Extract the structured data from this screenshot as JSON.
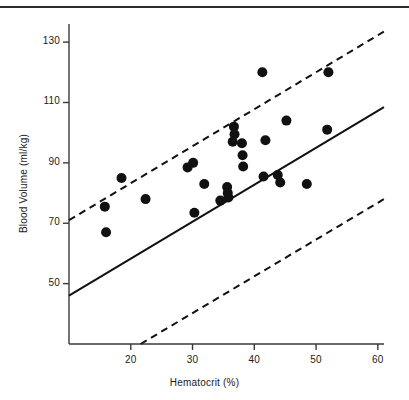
{
  "chart_data": {
    "type": "scatter",
    "title": "",
    "xlabel": "Hematocrit (%)",
    "ylabel": "Blood Volume (ml/kg)",
    "xlim": [
      10,
      61
    ],
    "ylim": [
      30,
      136
    ],
    "xticks": [
      20,
      30,
      40,
      50,
      60
    ],
    "yticks": [
      50,
      70,
      90,
      110,
      130
    ],
    "grid": false,
    "legend": null,
    "marker": {
      "shape": "circle",
      "color": "#111111",
      "size": 5
    },
    "points": [
      {
        "x": 15.8,
        "y": 75.5
      },
      {
        "x": 16.0,
        "y": 67.0
      },
      {
        "x": 18.5,
        "y": 85.0
      },
      {
        "x": 22.4,
        "y": 78.0
      },
      {
        "x": 29.2,
        "y": 88.5
      },
      {
        "x": 30.1,
        "y": 90.0
      },
      {
        "x": 30.3,
        "y": 73.5
      },
      {
        "x": 31.9,
        "y": 83.0
      },
      {
        "x": 34.5,
        "y": 77.5
      },
      {
        "x": 35.6,
        "y": 82.0
      },
      {
        "x": 35.7,
        "y": 80.0
      },
      {
        "x": 35.8,
        "y": 78.5
      },
      {
        "x": 36.5,
        "y": 97.0
      },
      {
        "x": 36.7,
        "y": 102.0
      },
      {
        "x": 36.8,
        "y": 99.5
      },
      {
        "x": 38.0,
        "y": 96.5
      },
      {
        "x": 38.1,
        "y": 92.5
      },
      {
        "x": 38.2,
        "y": 88.8
      },
      {
        "x": 41.3,
        "y": 120.0
      },
      {
        "x": 41.5,
        "y": 85.5
      },
      {
        "x": 41.8,
        "y": 97.5
      },
      {
        "x": 43.8,
        "y": 86.0
      },
      {
        "x": 44.2,
        "y": 83.5
      },
      {
        "x": 45.2,
        "y": 104.0
      },
      {
        "x": 48.5,
        "y": 83.0
      },
      {
        "x": 51.8,
        "y": 101.0
      },
      {
        "x": 52.0,
        "y": 120.0
      }
    ],
    "lines": [
      {
        "name": "regression-line",
        "style": "solid",
        "color": "#111111",
        "x0": 10.0,
        "y0": 46.0,
        "x1": 61.0,
        "y1": 108.5
      },
      {
        "name": "upper-limit-line",
        "style": "dashed",
        "color": "#111111",
        "x0": 10.0,
        "y0": 71.0,
        "x1": 61.0,
        "y1": 133.5
      },
      {
        "name": "lower-limit-line",
        "style": "dashed",
        "color": "#111111",
        "x0": 21.6,
        "y0": 30.0,
        "x1": 61.0,
        "y1": 78.0
      }
    ]
  },
  "axes": {
    "y_tick_labels": [
      "130",
      "110",
      "90",
      "70",
      "50"
    ],
    "x_tick_labels": [
      "20",
      "30",
      "40",
      "50",
      "60"
    ],
    "x_title": "Hematocrit (%)",
    "y_title": "Blood Volume (ml/kg)"
  },
  "colors": {
    "ink": "#111111",
    "axis": "#3a3a3a",
    "rule": "#2b2b2b",
    "background": "#ffffff"
  }
}
